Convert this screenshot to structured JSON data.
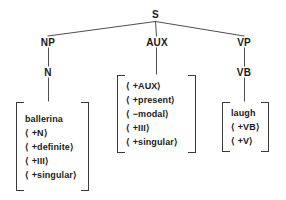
{
  "diagram": {
    "line_color": "#3a3a3a",
    "text_color": "#1a1a1a",
    "background": "#ffffff",
    "nodes": {
      "root": "S",
      "np": "NP",
      "aux": "AUX",
      "vp": "VP",
      "n": "N",
      "vb": "VB"
    },
    "matrices": {
      "np_matrix": {
        "rows": [
          "ballerina",
          "⟨ +N⟩",
          "⟨ +definite⟩",
          "⟨ +III⟩",
          "⟨ +singular⟩"
        ]
      },
      "aux_matrix": {
        "rows": [
          "⟨ +AUX⟩",
          "⟨ +present⟩",
          "⟨ −modal⟩",
          "⟨ +III⟩",
          "⟨ +singular⟩"
        ]
      },
      "vp_matrix": {
        "rows": [
          "laugh",
          "⟨ +VB⟩",
          "⟨ +V⟩"
        ]
      }
    }
  }
}
